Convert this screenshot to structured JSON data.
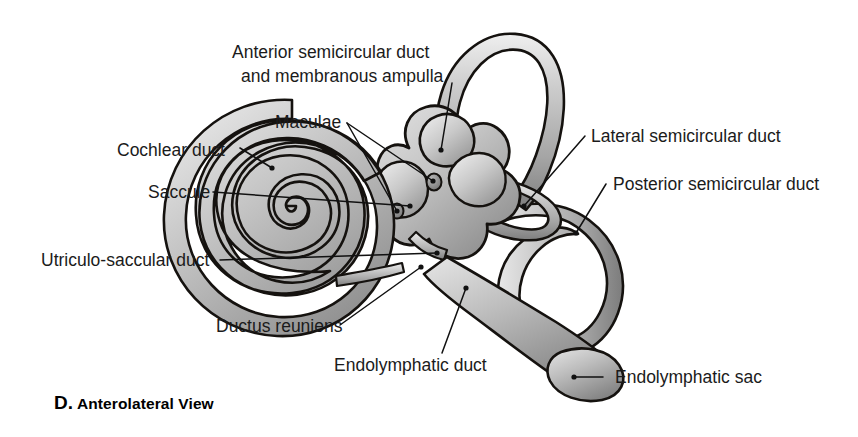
{
  "figure": {
    "title_letter": "D.",
    "title_text": "Anterolateral View",
    "background_color": "#ffffff",
    "ink_color": "#15120f",
    "fill_light": "#d8d8d8",
    "fill_mid": "#b4b4b4",
    "fill_dark": "#8d8d8d"
  },
  "labels": {
    "anterior_duct_line1": "Anterior semicircular duct",
    "anterior_duct_line2": "and membranous ampulla",
    "maculae": "Maculae",
    "cochlear_duct": "Cochlear duct",
    "saccule": "Saccule",
    "utriculo_saccular_duct": "Utriculo-saccular duct",
    "ductus_reuniens": "Ductus reuniens",
    "endolymphatic_duct": "Endolymphatic duct",
    "endolymphatic_sac": "Endolymphatic sac",
    "lateral_duct": "Lateral semicircular duct",
    "posterior_duct": "Posterior semicircular duct"
  }
}
